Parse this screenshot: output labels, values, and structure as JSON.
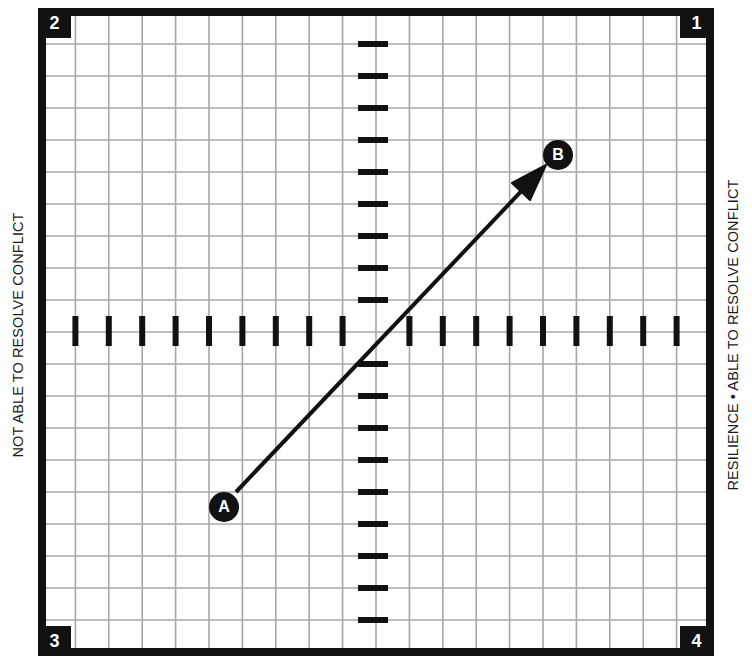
{
  "diagram": {
    "title": "",
    "left_label": "NOT ABLE TO RESOLVE CONFLICT",
    "right_label": "RESILIENCE • ABLE TO RESOLVE CONFLICT",
    "quadrants": [
      {
        "id": "1",
        "label": "1",
        "position": "top-right"
      },
      {
        "id": "2",
        "label": "2",
        "position": "top-left"
      },
      {
        "id": "3",
        "label": "3",
        "position": "bottom-left"
      },
      {
        "id": "4",
        "label": "4",
        "position": "bottom-right"
      }
    ],
    "points": [
      {
        "id": "A",
        "label": "A"
      },
      {
        "id": "B",
        "label": "B"
      }
    ],
    "arrow": {
      "from": "A",
      "to": "B"
    },
    "grid": {
      "columns": 20,
      "rows": 20
    },
    "axes": {
      "horizontal_ticks": 18,
      "vertical_ticks": 18
    },
    "colors": {
      "frame": "#111111",
      "grid_line": "#a8a8a8",
      "background": "#ffffff",
      "ink": "#111111"
    }
  }
}
